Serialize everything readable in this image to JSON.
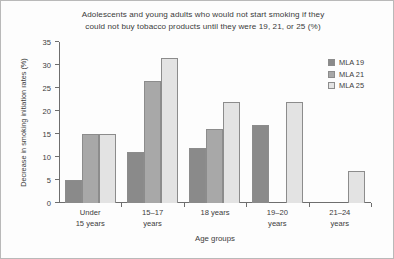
{
  "chart_data": {
    "type": "bar",
    "title": "Adolescents and young adults who would not start smoking if they could not buy tobacco products until they were 19, 21, or 25 (%)",
    "title_line1": "Adolescents and young adults who would not start smoking if they",
    "title_line2": "could not buy tobacco products until they were 19, 21, or 25 (%)",
    "xlabel": "Age groups",
    "ylabel": "Decrease in smoking initiation rates (%)",
    "ylim": [
      0,
      35
    ],
    "yticks": [
      0,
      5,
      10,
      15,
      20,
      25,
      30,
      35
    ],
    "ytick_labels": [
      "0",
      "5",
      "10",
      "15",
      "20",
      "25",
      "30",
      "35"
    ],
    "grid": false,
    "legend_position": "top-right",
    "categories": [
      "Under 15 years",
      "15–17 years",
      "18 years",
      "19–20 years",
      "21–24 years"
    ],
    "category_lines": [
      [
        "Under",
        "15 years"
      ],
      [
        "15–17",
        "years"
      ],
      [
        "18 years",
        ""
      ],
      [
        "19–20",
        "years"
      ],
      [
        "21–24",
        "years"
      ]
    ],
    "series": [
      {
        "name": "MLA 19",
        "color": "#8a8a8a",
        "values": [
          5,
          11,
          12,
          17,
          null
        ]
      },
      {
        "name": "MLA 21",
        "color": "#a8a8a8",
        "values": [
          15,
          26.5,
          16,
          null,
          null
        ]
      },
      {
        "name": "MLA 25",
        "color": "#e3e3e3",
        "values": [
          15,
          31.5,
          22,
          22,
          7
        ]
      }
    ]
  },
  "legend": {
    "items": [
      {
        "label": "MLA 19",
        "color": "#8a8a8a"
      },
      {
        "label": "MLA 21",
        "color": "#a8a8a8"
      },
      {
        "label": "MLA 25",
        "color": "#e3e3e3"
      }
    ]
  }
}
